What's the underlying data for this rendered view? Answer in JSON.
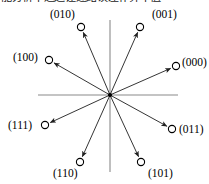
{
  "caption": {
    "text": "能分析干通过让述路误差补算干值"
  },
  "diagram": {
    "center": {
      "x": 110,
      "y": 95
    },
    "axes": {
      "horizontal": {
        "x1": 38,
        "y1": 95,
        "x2": 178,
        "y2": 95
      },
      "vertical": {
        "x1": 110,
        "y1": 20,
        "x2": 110,
        "y2": 172
      },
      "color": "#8a8a8a"
    },
    "marker": {
      "radius": 3.6,
      "stroke": "#000000",
      "fill": "#ffffff"
    },
    "arrow_color": "#2a2a2a",
    "points": [
      {
        "code": "(010)",
        "name": "vector-010",
        "cx": 81,
        "cy": 27,
        "lx": 50,
        "ly": 8
      },
      {
        "code": "(001)",
        "name": "vector-001",
        "cx": 140,
        "cy": 27,
        "lx": 152,
        "ly": 8
      },
      {
        "code": "(100)",
        "name": "vector-100",
        "cx": 49,
        "cy": 60,
        "lx": 13,
        "ly": 51
      },
      {
        "code": "(000)",
        "name": "vector-000",
        "cx": 176,
        "cy": 66,
        "lx": 182,
        "ly": 56
      },
      {
        "code": "(111)",
        "name": "vector-111",
        "cx": 45,
        "cy": 125,
        "lx": 8,
        "ly": 119
      },
      {
        "code": "(011)",
        "name": "vector-011",
        "cx": 172,
        "cy": 129,
        "lx": 179,
        "ly": 123
      },
      {
        "code": "(110)",
        "name": "vector-110",
        "cx": 80,
        "cy": 162,
        "lx": 53,
        "ly": 167
      },
      {
        "code": "(101)",
        "name": "vector-101",
        "cx": 141,
        "cy": 162,
        "lx": 148,
        "ly": 167
      }
    ]
  }
}
